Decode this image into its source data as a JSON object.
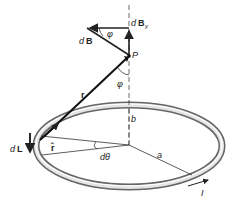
{
  "diagram": {
    "labels": {
      "dB_d": "d",
      "dB_B": "B",
      "dBy_d": "d",
      "dBy_B": "B",
      "dBy_sub": "y",
      "phi_top": "φ",
      "phi_mid": "φ",
      "P": "P",
      "r": "r",
      "b": "b",
      "dL_d": "d",
      "dL_L": "L",
      "r_hat": "r̂",
      "dtheta": "dθ",
      "a": "a",
      "I": "I"
    },
    "colors": {
      "stroke": "#222222",
      "ring_outer": "#6f6f6f",
      "ring_inner": "#dcdcdc",
      "background": "#ffffff"
    }
  }
}
